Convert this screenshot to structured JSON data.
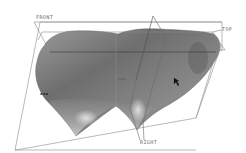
{
  "viewport": {
    "background": "#ffffff",
    "surface_color": "#7a7a7a",
    "datum_line_color": "#8a8a8a",
    "datum_planes": [
      {
        "name": "FRONT",
        "label": "FRONT"
      },
      {
        "name": "TOP",
        "label": "TOP"
      },
      {
        "name": "RIGHT",
        "label": "RIGHT"
      }
    ],
    "surface_marker": "▪▪▪",
    "cursor": "arrow-cursor"
  }
}
